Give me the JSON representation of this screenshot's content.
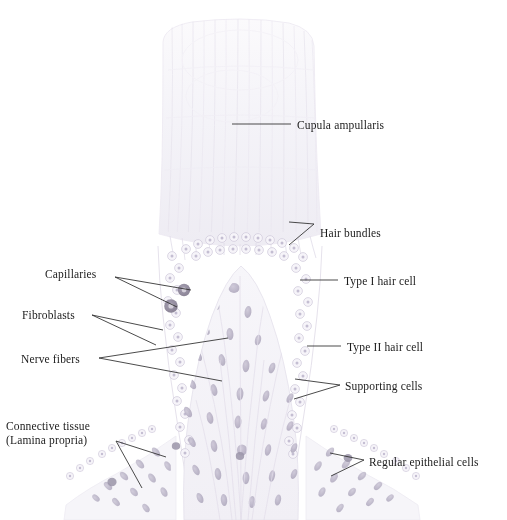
{
  "figure": {
    "top_cut_text": "",
    "background_color": "#ffffff",
    "ink_color": "#2b2b2b",
    "tissue_tint": "#e9e7ef",
    "nucleus_color": "#b9b4c6",
    "capillary_color": "#8d8798",
    "cupula_tint": "#f4f3f7"
  },
  "labels": [
    {
      "id": "cupula-ampullaris",
      "text": "Cupula ampullaris",
      "x": 297,
      "y": 119,
      "side": "right",
      "leader_kind": "single"
    },
    {
      "id": "hair-bundles",
      "text": "Hair bundles",
      "x": 320,
      "y": 227,
      "side": "right",
      "leader_kind": "forked"
    },
    {
      "id": "type-i-hair-cell",
      "text": "Type I hair cell",
      "x": 344,
      "y": 275,
      "side": "right",
      "leader_kind": "single"
    },
    {
      "id": "type-ii-hair-cell",
      "text": "Type II hair cell",
      "x": 347,
      "y": 341,
      "side": "right",
      "leader_kind": "single"
    },
    {
      "id": "supporting-cells",
      "text": "Supporting cells",
      "x": 345,
      "y": 380,
      "side": "right",
      "leader_kind": "forked"
    },
    {
      "id": "regular-epithelial-cells",
      "text": "Regular epithelial cells",
      "x": 369,
      "y": 456,
      "side": "right",
      "leader_kind": "forked"
    },
    {
      "id": "capillaries",
      "text": "Capillaries",
      "x": 45,
      "y": 268,
      "side": "left",
      "leader_kind": "forked"
    },
    {
      "id": "fibroblasts",
      "text": "Fibroblasts",
      "x": 22,
      "y": 309,
      "side": "left",
      "leader_kind": "forked"
    },
    {
      "id": "nerve-fibers",
      "text": "Nerve fibers",
      "x": 21,
      "y": 353,
      "side": "left",
      "leader_kind": "forked"
    },
    {
      "id": "connective-tissue",
      "text": "Connective tissue",
      "text_line2": "(Lamina propria)",
      "x": 6,
      "y": 420,
      "side": "left",
      "leader_kind": "forked"
    }
  ],
  "structures": [
    {
      "id": "cupula",
      "name": "Cupula ampullaris",
      "description": "Tall gelatinous dome above the sensory epithelium"
    },
    {
      "id": "crista",
      "name": "Crista ampullaris",
      "description": "Saddle-shaped sensory ridge"
    },
    {
      "id": "sensory-epithelium",
      "name": "Sensory epithelium",
      "description": "Hair cells and supporting cells lining the crista"
    },
    {
      "id": "lamina-propria",
      "name": "Lamina propria",
      "description": "Connective tissue core containing nerve fibers, fibroblasts, and capillaries"
    },
    {
      "id": "transitional-epithelium",
      "name": "Regular epithelial cells",
      "description": "Cuboidal epithelium flanking the crista"
    }
  ]
}
